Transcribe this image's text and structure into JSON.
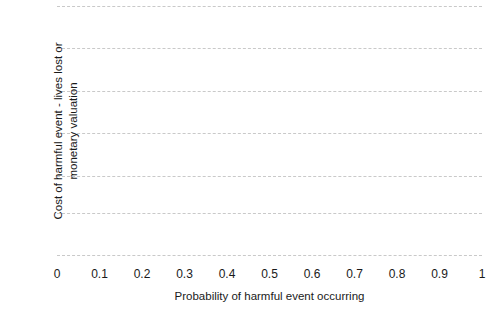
{
  "chart_data": {
    "type": "line",
    "title": "",
    "subtitle": "",
    "xlabel": "Probability of harmful event occurring",
    "ylabel_lines": [
      "Cost of harmful event - lives lost or",
      "monetary valuation"
    ],
    "ylabel": "Cost of harmful event - lives lost or monetary valuation",
    "x_tick_labels": [
      "0",
      "0.1",
      "0.2",
      "0.3",
      "0.4",
      "0.5",
      "0.6",
      "0.7",
      "0.8",
      "0.9",
      "1"
    ],
    "x_tick_values": [
      0,
      0.1,
      0.2,
      0.3,
      0.4,
      0.5,
      0.6,
      0.7,
      0.8,
      0.9,
      1
    ],
    "y_tick_labels": [],
    "y_tick_values": [],
    "xlim": [
      0,
      1
    ],
    "ylim": [
      0,
      1
    ],
    "grid": "horizontal-dashed",
    "gridline_count": 7,
    "gridline_positions_px": [
      6,
      48,
      91,
      133,
      176,
      213,
      255
    ],
    "legend": [],
    "series": [],
    "annotations": [],
    "colors": {
      "background": "#ffffff",
      "grid": "#c9c9c9",
      "text": "#1a1a1a"
    }
  }
}
